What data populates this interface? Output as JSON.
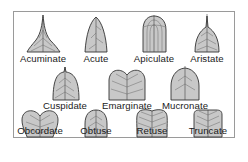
{
  "diagram": {
    "colors": {
      "leaf_fill": "#c8c8c8",
      "leaf_stroke": "#333333",
      "vein": "#6a6a6a",
      "frame": "#9a9a9a",
      "text": "#1a1a1a"
    },
    "rows": [
      {
        "items": [
          {
            "label": "Acuminate",
            "shape": "acuminate-leaf"
          },
          {
            "label": "Acute",
            "shape": "acute-leaf"
          },
          {
            "label": "Apiculate",
            "shape": "apiculate-leaf"
          },
          {
            "label": "Aristate",
            "shape": "aristate-leaf"
          }
        ]
      },
      {
        "items": [
          {
            "label": "Cuspidate",
            "shape": "cuspidate-leaf"
          },
          {
            "label": "Emarginate",
            "shape": "emarginate-leaf"
          },
          {
            "label": "Mucronate",
            "shape": "mucronate-leaf"
          }
        ]
      },
      {
        "items": [
          {
            "label": "Obcordate",
            "shape": "obcordate-leaf"
          },
          {
            "label": "Obtuse",
            "shape": "obtuse-leaf"
          },
          {
            "label": "Retuse",
            "shape": "retuse-leaf"
          },
          {
            "label": "Truncate",
            "shape": "truncate-leaf"
          }
        ]
      }
    ]
  }
}
